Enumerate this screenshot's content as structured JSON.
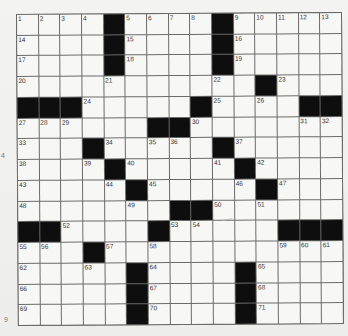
{
  "puzzle": {
    "rows": 15,
    "cols": 15,
    "layout": [
      "....#....#.....",
      "....#....#.....",
      "....#....#.....",
      "...........#...",
      "###.....#....##",
      "......##.......",
      "...#.....#.....",
      "....#.....#....",
      ".....#.....#...",
      ".......##......",
      "##....#.....###",
      "...#...........",
      ".....#....#....",
      ".....#....#....",
      ".....#....#...."
    ],
    "numbers": [
      [
        1,
        2,
        3,
        4,
        null,
        5,
        6,
        7,
        8,
        null,
        9,
        10,
        11,
        12,
        13
      ],
      [
        14,
        null,
        null,
        null,
        null,
        15,
        null,
        null,
        null,
        null,
        16,
        null,
        null,
        null,
        null
      ],
      [
        17,
        null,
        null,
        null,
        null,
        18,
        null,
        null,
        null,
        null,
        19,
        null,
        null,
        null,
        null
      ],
      [
        20,
        null,
        null,
        null,
        21,
        null,
        null,
        null,
        null,
        22,
        null,
        null,
        23,
        null,
        null
      ],
      [
        null,
        null,
        null,
        24,
        null,
        null,
        null,
        null,
        null,
        25,
        null,
        26,
        null,
        null,
        null
      ],
      [
        27,
        28,
        29,
        null,
        null,
        null,
        null,
        null,
        30,
        null,
        null,
        null,
        null,
        31,
        32
      ],
      [
        33,
        null,
        null,
        null,
        34,
        null,
        35,
        36,
        null,
        null,
        37,
        null,
        null,
        null,
        null
      ],
      [
        38,
        null,
        null,
        39,
        null,
        40,
        null,
        null,
        null,
        41,
        null,
        42,
        null,
        null,
        null
      ],
      [
        43,
        null,
        null,
        null,
        44,
        null,
        45,
        null,
        null,
        null,
        46,
        null,
        47,
        null,
        null
      ],
      [
        48,
        null,
        null,
        null,
        null,
        49,
        null,
        null,
        null,
        50,
        null,
        51,
        null,
        null,
        null
      ],
      [
        null,
        null,
        52,
        null,
        null,
        null,
        null,
        53,
        54,
        null,
        null,
        null,
        null,
        null,
        null
      ],
      [
        55,
        56,
        null,
        null,
        57,
        null,
        58,
        null,
        null,
        null,
        null,
        null,
        59,
        60,
        61
      ],
      [
        62,
        null,
        null,
        63,
        null,
        null,
        64,
        null,
        null,
        null,
        null,
        65,
        null,
        null,
        null
      ],
      [
        66,
        null,
        null,
        null,
        null,
        null,
        67,
        null,
        null,
        null,
        null,
        68,
        null,
        null,
        null
      ],
      [
        69,
        null,
        null,
        null,
        null,
        null,
        70,
        null,
        null,
        null,
        null,
        71,
        null,
        null,
        null
      ]
    ]
  },
  "colors": {
    "black_cell": "#0e0e0e",
    "white_cell": "#f7f7f5",
    "grid_line": "#6a6a6a",
    "paper": "#f1f1ef"
  },
  "margin_marks": [
    {
      "text": "4",
      "x": 1,
      "y": 152
    },
    {
      "text": "9",
      "x": 4,
      "y": 316
    }
  ]
}
